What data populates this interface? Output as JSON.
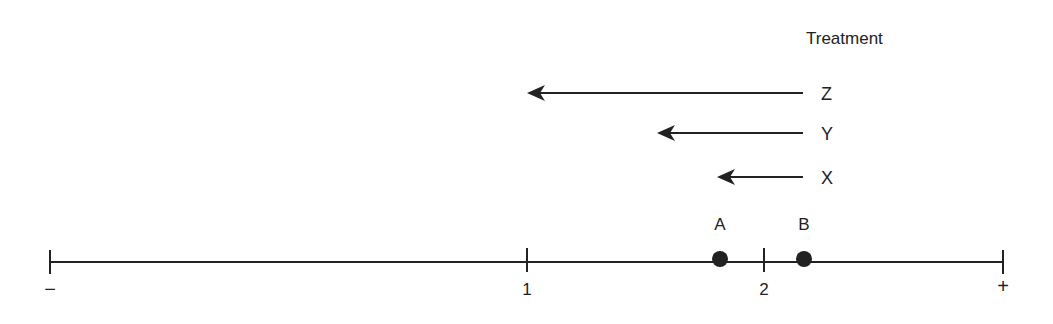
{
  "diagram": {
    "title": "Treatment",
    "line_color": "#222222",
    "axis": {
      "min_label": "−",
      "max_label": "+",
      "ticks": [
        {
          "label": "1",
          "x": 527
        },
        {
          "label": "2",
          "x": 764
        }
      ]
    },
    "points": [
      {
        "label": "A",
        "x": 720
      },
      {
        "label": "B",
        "x": 804
      }
    ],
    "arrows": [
      {
        "label": "Z",
        "from_x": 803,
        "to_x": 527,
        "y": 93
      },
      {
        "label": "Y",
        "from_x": 803,
        "to_x": 657,
        "y": 133
      },
      {
        "label": "X",
        "from_x": 803,
        "to_x": 717,
        "y": 177
      }
    ]
  }
}
